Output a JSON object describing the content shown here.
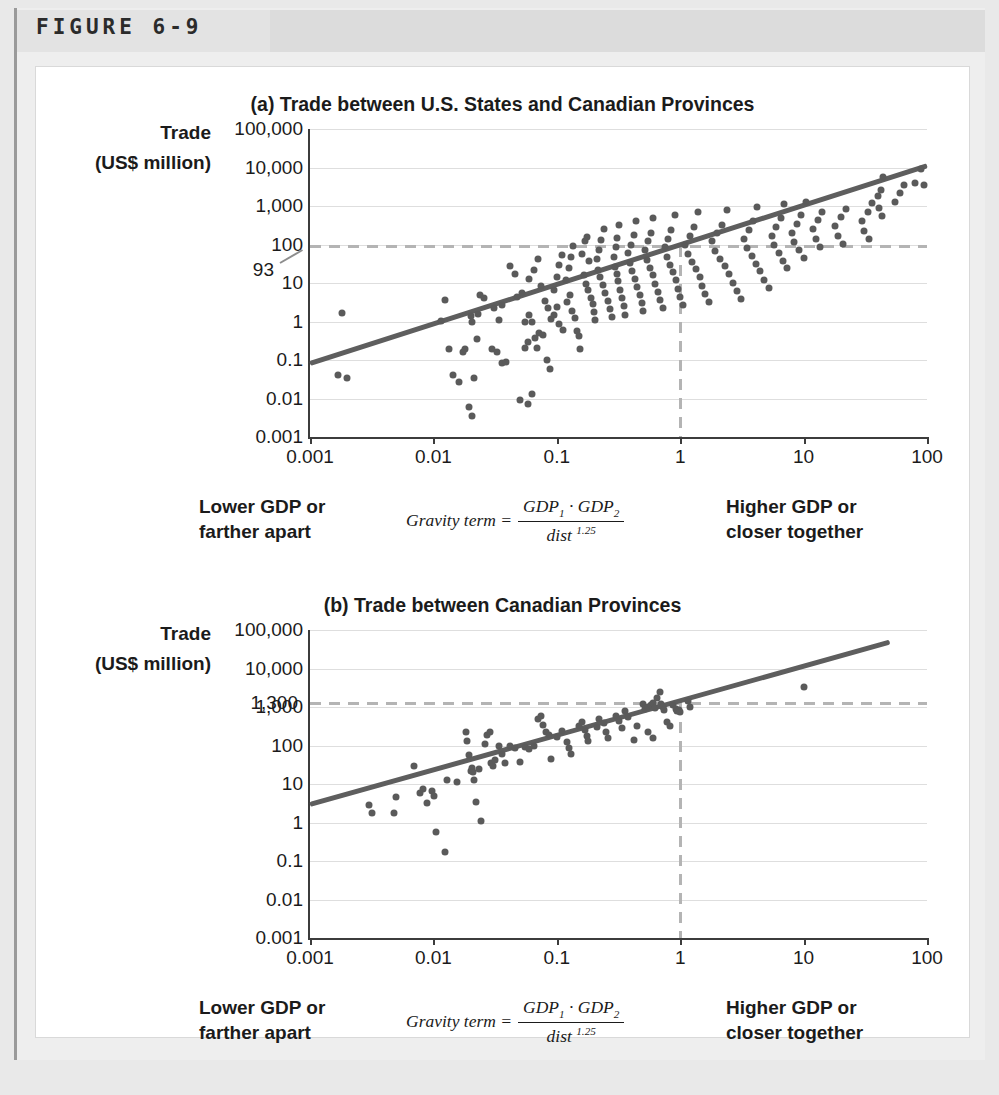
{
  "figure": {
    "label": "FIGURE 6-9"
  },
  "panels": [
    {
      "id": "a",
      "title": "(a) Trade between U.S. States and Canadian Provinces",
      "axis_title_line1": "Trade",
      "axis_title_line2": "(US$ million)",
      "annotation": "93",
      "caption_left_line1": "Lower GDP or",
      "caption_left_line2": "farther apart",
      "caption_right_line1": "Higher GDP or",
      "caption_right_line2": "closer together",
      "formula": {
        "lhs": "Gravity term =",
        "numerator_1": "GDP",
        "numerator_1_sub": "1",
        "numerator_op": " · ",
        "numerator_2": "GDP",
        "numerator_2_sub": "2",
        "denominator": "dist",
        "denominator_exp": "1.25"
      }
    },
    {
      "id": "b",
      "title": "(b) Trade between Canadian Provinces",
      "axis_title_line1": "Trade",
      "axis_title_line2": "(US$ million)",
      "annotation": "1,300",
      "caption_left_line1": "Lower GDP or",
      "caption_left_line2": "farther apart",
      "caption_right_line1": "Higher GDP or",
      "caption_right_line2": "closer together",
      "formula": {
        "lhs": "Gravity term =",
        "numerator_1": "GDP",
        "numerator_1_sub": "1",
        "numerator_op": " · ",
        "numerator_2": "GDP",
        "numerator_2_sub": "2",
        "denominator": "dist",
        "denominator_exp": "1.25"
      }
    }
  ],
  "colors": {
    "dot": "#5a5a5a",
    "trendline": "#5e5e5e",
    "gridline": "#dedede",
    "axis": "#3c3c3c",
    "dashed_guide": "#b4b4b4",
    "card_background": "#ffffff",
    "frame_background": "#eeeeee",
    "page_background": "#e9e9e9",
    "banner_background": "#e3e3e3",
    "text": "#1b1b1b"
  },
  "chart_data": [
    {
      "type": "scatter",
      "panel": "a",
      "title": "(a) Trade between U.S. States and Canadian Provinces",
      "xlabel": "Gravity term = (GDP_1 · GDP_2) / dist^1.25",
      "ylabel": "Trade (US$ million)",
      "xscale": "log",
      "yscale": "log",
      "xlim": [
        0.001,
        100
      ],
      "ylim": [
        0.001,
        100000
      ],
      "xticks": [
        "0.001",
        "0.01",
        "0.1",
        "1",
        "10",
        "100"
      ],
      "xtick_values": [
        0.001,
        0.01,
        0.1,
        1,
        10,
        100
      ],
      "yticks": [
        "0.001",
        "0.01",
        "0.1",
        "1",
        "10",
        "100",
        "1,000",
        "10,000",
        "100,000"
      ],
      "ytick_values": [
        0.001,
        0.01,
        0.1,
        1,
        10,
        100,
        1000,
        10000,
        100000
      ],
      "grid": true,
      "legend": "none",
      "annotations": [
        {
          "text": "93",
          "type": "y-guide",
          "y_value": 93,
          "x_value": 1,
          "note": "dashed guide lines mark trade of 93 at gravity term = 1"
        }
      ],
      "trendline": {
        "x": [
          0.001,
          100
        ],
        "y": [
          0.08,
          11000
        ],
        "note": "log-log fit, slope ~1.0"
      },
      "points": [
        [
          0.0018,
          1.7
        ],
        [
          0.0017,
          0.04
        ],
        [
          0.002,
          0.035
        ],
        [
          0.0115,
          1.05
        ],
        [
          0.0135,
          0.19
        ],
        [
          0.0145,
          0.04
        ],
        [
          0.016,
          0.027
        ],
        [
          0.0125,
          3.7
        ],
        [
          0.0175,
          0.16
        ],
        [
          0.0195,
          0.006
        ],
        [
          0.0205,
          0.0035
        ],
        [
          0.018,
          0.19
        ],
        [
          0.0215,
          0.035
        ],
        [
          0.023,
          1.6
        ],
        [
          0.024,
          5.0
        ],
        [
          0.0255,
          4.2
        ],
        [
          0.02,
          1.35
        ],
        [
          0.0205,
          1.0
        ],
        [
          0.0225,
          0.35
        ],
        [
          0.03,
          0.19
        ],
        [
          0.033,
          0.165
        ],
        [
          0.036,
          0.085
        ],
        [
          0.039,
          0.09
        ],
        [
          0.031,
          2.3
        ],
        [
          0.034,
          1.1
        ],
        [
          0.036,
          2.7
        ],
        [
          0.042,
          28
        ],
        [
          0.046,
          17
        ],
        [
          0.048,
          4.4
        ],
        [
          0.052,
          5.6
        ],
        [
          0.055,
          0.21
        ],
        [
          0.058,
          0.3
        ],
        [
          0.06,
          1.45
        ],
        [
          0.063,
          0.95
        ],
        [
          0.066,
          0.38
        ],
        [
          0.069,
          0.21
        ],
        [
          0.05,
          0.009
        ],
        [
          0.058,
          0.007
        ],
        [
          0.063,
          0.013
        ],
        [
          0.055,
          0.95
        ],
        [
          0.06,
          13
        ],
        [
          0.065,
          22
        ],
        [
          0.07,
          42
        ],
        [
          0.075,
          8.5
        ],
        [
          0.08,
          3.5
        ],
        [
          0.085,
          2.2
        ],
        [
          0.09,
          1.15
        ],
        [
          0.072,
          0.5
        ],
        [
          0.078,
          0.45
        ],
        [
          0.083,
          0.1
        ],
        [
          0.088,
          0.058
        ],
        [
          0.095,
          6.5
        ],
        [
          0.1,
          14
        ],
        [
          0.105,
          30
        ],
        [
          0.11,
          52
        ],
        [
          0.095,
          1.5
        ],
        [
          0.1,
          2.4
        ],
        [
          0.105,
          0.85
        ],
        [
          0.112,
          0.6
        ],
        [
          0.118,
          12
        ],
        [
          0.125,
          25
        ],
        [
          0.13,
          48
        ],
        [
          0.135,
          90
        ],
        [
          0.12,
          3.3
        ],
        [
          0.128,
          4.8
        ],
        [
          0.132,
          1.9
        ],
        [
          0.14,
          1.2
        ],
        [
          0.145,
          0.55
        ],
        [
          0.15,
          0.42
        ],
        [
          0.155,
          0.19
        ],
        [
          0.16,
          55
        ],
        [
          0.168,
          120
        ],
        [
          0.175,
          160
        ],
        [
          0.182,
          38
        ],
        [
          0.165,
          16
        ],
        [
          0.172,
          9.5
        ],
        [
          0.18,
          6.5
        ],
        [
          0.188,
          4.2
        ],
        [
          0.195,
          2.8
        ],
        [
          0.2,
          1.8
        ],
        [
          0.205,
          1.1
        ],
        [
          0.21,
          42
        ],
        [
          0.22,
          70
        ],
        [
          0.23,
          130
        ],
        [
          0.24,
          260
        ],
        [
          0.215,
          22
        ],
        [
          0.225,
          14
        ],
        [
          0.235,
          9.0
        ],
        [
          0.245,
          5.5
        ],
        [
          0.26,
          3.4
        ],
        [
          0.27,
          2.1
        ],
        [
          0.28,
          1.3
        ],
        [
          0.29,
          48
        ],
        [
          0.3,
          85
        ],
        [
          0.31,
          150
        ],
        [
          0.32,
          330
        ],
        [
          0.295,
          26
        ],
        [
          0.305,
          17
        ],
        [
          0.315,
          11
        ],
        [
          0.325,
          6.5
        ],
        [
          0.34,
          4.0
        ],
        [
          0.35,
          2.5
        ],
        [
          0.36,
          1.5
        ],
        [
          0.38,
          60
        ],
        [
          0.4,
          100
        ],
        [
          0.42,
          180
        ],
        [
          0.44,
          420
        ],
        [
          0.39,
          33
        ],
        [
          0.41,
          21
        ],
        [
          0.43,
          13
        ],
        [
          0.45,
          8.0
        ],
        [
          0.47,
          5.0
        ],
        [
          0.49,
          3.0
        ],
        [
          0.5,
          1.9
        ],
        [
          0.52,
          70
        ],
        [
          0.55,
          120
        ],
        [
          0.58,
          200
        ],
        [
          0.6,
          500
        ],
        [
          0.54,
          40
        ],
        [
          0.57,
          25
        ],
        [
          0.6,
          16
        ],
        [
          0.63,
          9.5
        ],
        [
          0.66,
          6.0
        ],
        [
          0.69,
          3.6
        ],
        [
          0.72,
          2.3
        ],
        [
          0.75,
          85
        ],
        [
          0.8,
          140
        ],
        [
          0.85,
          240
        ],
        [
          0.9,
          600
        ],
        [
          0.78,
          48
        ],
        [
          0.83,
          30
        ],
        [
          0.88,
          19
        ],
        [
          0.93,
          12
        ],
        [
          0.96,
          7.0
        ],
        [
          1.0,
          4.3
        ],
        [
          1.05,
          2.7
        ],
        [
          1.1,
          100
        ],
        [
          1.2,
          170
        ],
        [
          1.3,
          280
        ],
        [
          1.4,
          700
        ],
        [
          1.15,
          58
        ],
        [
          1.25,
          36
        ],
        [
          1.35,
          23
        ],
        [
          1.45,
          14
        ],
        [
          1.5,
          8.5
        ],
        [
          1.6,
          5.2
        ],
        [
          1.7,
          3.2
        ],
        [
          1.8,
          120
        ],
        [
          2.0,
          200
        ],
        [
          2.2,
          330
        ],
        [
          2.4,
          800
        ],
        [
          1.9,
          68
        ],
        [
          2.1,
          43
        ],
        [
          2.3,
          27
        ],
        [
          2.5,
          17
        ],
        [
          2.7,
          10
        ],
        [
          2.9,
          6.2
        ],
        [
          3.1,
          3.8
        ],
        [
          3.3,
          140
        ],
        [
          3.6,
          240
        ],
        [
          3.9,
          400
        ],
        [
          4.2,
          950
        ],
        [
          3.5,
          80
        ],
        [
          3.8,
          50
        ],
        [
          4.1,
          32
        ],
        [
          4.4,
          20
        ],
        [
          4.8,
          12
        ],
        [
          5.2,
          7.4
        ],
        [
          5.5,
          170
        ],
        [
          6.0,
          290
        ],
        [
          6.5,
          480
        ],
        [
          7.0,
          1100
        ],
        [
          5.8,
          95
        ],
        [
          6.3,
          60
        ],
        [
          6.8,
          38
        ],
        [
          7.4,
          24
        ],
        [
          8.0,
          200
        ],
        [
          8.8,
          350
        ],
        [
          9.5,
          580
        ],
        [
          10.5,
          1300
        ],
        [
          8.4,
          115
        ],
        [
          9.2,
          72
        ],
        [
          10.0,
          45
        ],
        [
          12,
          250
        ],
        [
          13,
          430
        ],
        [
          14,
          700
        ],
        [
          12.5,
          140
        ],
        [
          13.5,
          88
        ],
        [
          18,
          300
        ],
        [
          20,
          520
        ],
        [
          22,
          850
        ],
        [
          19,
          170
        ],
        [
          21,
          105
        ],
        [
          30,
          400
        ],
        [
          33,
          700
        ],
        [
          36,
          1200
        ],
        [
          31,
          230
        ],
        [
          34,
          140
        ],
        [
          40,
          1800
        ],
        [
          42,
          2600
        ],
        [
          44,
          5500
        ],
        [
          41,
          900
        ],
        [
          43,
          550
        ],
        [
          55,
          1300
        ],
        [
          60,
          2200
        ],
        [
          65,
          3600
        ],
        [
          80,
          4000
        ],
        [
          90,
          9000
        ],
        [
          95,
          3500
        ]
      ]
    },
    {
      "type": "scatter",
      "panel": "b",
      "title": "(b) Trade between Canadian Provinces",
      "xlabel": "Gravity term = (GDP_1 · GDP_2) / dist^1.25",
      "ylabel": "Trade (US$ million)",
      "xscale": "log",
      "yscale": "log",
      "xlim": [
        0.001,
        100
      ],
      "ylim": [
        0.001,
        100000
      ],
      "xticks": [
        "0.001",
        "0.01",
        "0.1",
        "1",
        "10",
        "100"
      ],
      "xtick_values": [
        0.001,
        0.01,
        0.1,
        1,
        10,
        100
      ],
      "yticks": [
        "0.001",
        "0.01",
        "0.1",
        "1",
        "10",
        "100",
        "1,000",
        "10,000",
        "100,000"
      ],
      "ytick_values": [
        0.001,
        0.01,
        0.1,
        1,
        10,
        100,
        1000,
        10000,
        100000
      ],
      "grid": true,
      "legend": "none",
      "annotations": [
        {
          "text": "1,300",
          "type": "y-guide",
          "y_value": 1300,
          "x_value": 1,
          "note": "dashed guide lines mark trade of 1,300 at gravity term = 1"
        }
      ],
      "trendline": {
        "x": [
          0.001,
          50
        ],
        "y": [
          3.0,
          50000
        ],
        "note": "log-log fit, slope ~0.86"
      },
      "points": [
        [
          0.003,
          2.8
        ],
        [
          0.0032,
          1.8
        ],
        [
          0.0048,
          1.8
        ],
        [
          0.005,
          4.6
        ],
        [
          0.007,
          30
        ],
        [
          0.0078,
          6.0
        ],
        [
          0.0082,
          7.2
        ],
        [
          0.0088,
          3.3
        ],
        [
          0.0098,
          6.5
        ],
        [
          0.0102,
          5.0
        ],
        [
          0.0105,
          0.55
        ],
        [
          0.0125,
          0.17
        ],
        [
          0.0128,
          13
        ],
        [
          0.0155,
          11
        ],
        [
          0.0185,
          230
        ],
        [
          0.0188,
          130
        ],
        [
          0.0195,
          55
        ],
        [
          0.02,
          22
        ],
        [
          0.0205,
          26
        ],
        [
          0.021,
          20
        ],
        [
          0.0215,
          13
        ],
        [
          0.022,
          3.5
        ],
        [
          0.0232,
          24
        ],
        [
          0.0245,
          1.1
        ],
        [
          0.026,
          110
        ],
        [
          0.0272,
          190
        ],
        [
          0.0285,
          230
        ],
        [
          0.0292,
          36
        ],
        [
          0.0305,
          30
        ],
        [
          0.0318,
          42
        ],
        [
          0.034,
          95
        ],
        [
          0.036,
          60
        ],
        [
          0.038,
          35
        ],
        [
          0.042,
          100
        ],
        [
          0.046,
          85
        ],
        [
          0.05,
          38
        ],
        [
          0.055,
          90
        ],
        [
          0.06,
          80
        ],
        [
          0.065,
          95
        ],
        [
          0.07,
          500
        ],
        [
          0.074,
          600
        ],
        [
          0.078,
          350
        ],
        [
          0.082,
          230
        ],
        [
          0.086,
          190
        ],
        [
          0.09,
          45
        ],
        [
          0.1,
          170
        ],
        [
          0.11,
          240
        ],
        [
          0.12,
          120
        ],
        [
          0.125,
          85
        ],
        [
          0.13,
          60
        ],
        [
          0.15,
          320
        ],
        [
          0.16,
          420
        ],
        [
          0.17,
          250
        ],
        [
          0.175,
          180
        ],
        [
          0.18,
          130
        ],
        [
          0.21,
          300
        ],
        [
          0.22,
          500
        ],
        [
          0.24,
          380
        ],
        [
          0.25,
          220
        ],
        [
          0.26,
          160
        ],
        [
          0.3,
          600
        ],
        [
          0.32,
          430
        ],
        [
          0.34,
          290
        ],
        [
          0.36,
          800
        ],
        [
          0.38,
          560
        ],
        [
          0.42,
          140
        ],
        [
          0.45,
          330
        ],
        [
          0.5,
          1200
        ],
        [
          0.52,
          900
        ],
        [
          0.55,
          1000
        ],
        [
          0.58,
          1100
        ],
        [
          0.6,
          1250
        ],
        [
          0.62,
          950
        ],
        [
          0.55,
          230
        ],
        [
          0.6,
          160
        ],
        [
          0.65,
          1700
        ],
        [
          0.68,
          2400
        ],
        [
          0.7,
          1200
        ],
        [
          0.72,
          1000
        ],
        [
          0.74,
          850
        ],
        [
          0.78,
          400
        ],
        [
          0.82,
          320
        ],
        [
          0.88,
          1100
        ],
        [
          0.92,
          900
        ],
        [
          0.95,
          780
        ],
        [
          0.98,
          820
        ],
        [
          1.0,
          750
        ],
        [
          1.15,
          1400
        ],
        [
          1.2,
          1000
        ],
        [
          10,
          3300
        ]
      ]
    }
  ]
}
